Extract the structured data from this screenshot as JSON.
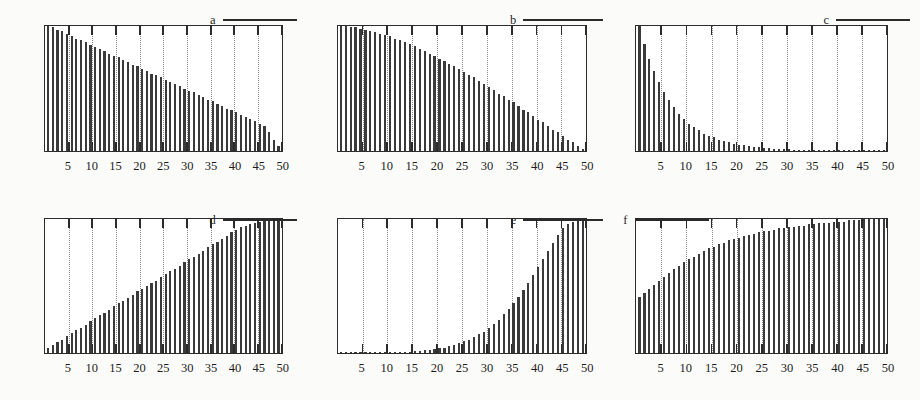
{
  "figure": {
    "title": "",
    "panel_count": 6,
    "layout": "2 rows x 3 columns",
    "ink_color": "#3a3a3a",
    "frame_color": "#2c2c2c",
    "gridline_color": "#8a8a8a",
    "background_color": "#fbfbfa"
  },
  "axis": {
    "tick_labels": [
      "5",
      "10",
      "15",
      "20",
      "25",
      "30",
      "35",
      "40",
      "45",
      "50"
    ],
    "tick_values": [
      5,
      10,
      15,
      20,
      25,
      30,
      35,
      40,
      45,
      50
    ],
    "xmin": 0,
    "xmax": 50,
    "xlabel": "",
    "ylabel": ""
  },
  "chart_data": [
    {
      "type": "bar",
      "panel": "a",
      "title": "a",
      "legend": "a",
      "legend_position": "top-right",
      "xlabel": "",
      "ylabel": "",
      "xlim": [
        0,
        50
      ],
      "ylim": [
        0,
        100
      ],
      "grid": true,
      "categories": [
        1,
        2,
        3,
        4,
        5,
        6,
        7,
        8,
        9,
        10,
        11,
        12,
        13,
        14,
        15,
        16,
        17,
        18,
        19,
        20,
        21,
        22,
        23,
        24,
        25,
        26,
        27,
        28,
        29,
        30,
        31,
        32,
        33,
        34,
        35,
        36,
        37,
        38,
        39,
        40,
        41,
        42,
        43,
        44,
        45,
        46,
        47,
        48,
        49,
        50
      ],
      "values": [
        100,
        99,
        97,
        96,
        94,
        92,
        90,
        89,
        87,
        85,
        83,
        82,
        80,
        78,
        76,
        75,
        73,
        71,
        69,
        68,
        66,
        64,
        62,
        61,
        59,
        57,
        55,
        54,
        52,
        50,
        48,
        47,
        45,
        43,
        41,
        40,
        38,
        36,
        34,
        33,
        31,
        29,
        27,
        26,
        24,
        22,
        20,
        15,
        9,
        4
      ]
    },
    {
      "type": "bar",
      "panel": "b",
      "title": "b",
      "legend": "b",
      "legend_position": "top-right",
      "xlabel": "",
      "ylabel": "",
      "xlim": [
        0,
        50
      ],
      "ylim": [
        0,
        100
      ],
      "grid": true,
      "categories": [
        1,
        2,
        3,
        4,
        5,
        6,
        7,
        8,
        9,
        10,
        11,
        12,
        13,
        14,
        15,
        16,
        17,
        18,
        19,
        20,
        21,
        22,
        23,
        24,
        25,
        26,
        27,
        28,
        29,
        30,
        31,
        32,
        33,
        34,
        35,
        36,
        37,
        38,
        39,
        40,
        41,
        42,
        43,
        44,
        45,
        46,
        47,
        48,
        49,
        50
      ],
      "values": [
        100,
        100,
        99,
        99,
        98,
        97,
        96,
        95,
        94,
        93,
        92,
        90,
        89,
        87,
        86,
        84,
        82,
        80,
        78,
        76,
        74,
        72,
        70,
        68,
        66,
        63,
        61,
        59,
        56,
        54,
        51,
        49,
        46,
        44,
        41,
        39,
        36,
        33,
        31,
        28,
        25,
        23,
        20,
        17,
        15,
        12,
        9,
        7,
        4,
        2
      ]
    },
    {
      "type": "bar",
      "panel": "c",
      "title": "c",
      "legend": "c",
      "legend_position": "top-right",
      "xlabel": "",
      "ylabel": "",
      "xlim": [
        0,
        50
      ],
      "ylim": [
        0,
        100
      ],
      "grid": true,
      "categories": [
        1,
        2,
        3,
        4,
        5,
        6,
        7,
        8,
        9,
        10,
        11,
        12,
        13,
        14,
        15,
        16,
        17,
        18,
        19,
        20,
        21,
        22,
        23,
        24,
        25,
        26,
        27,
        28,
        29,
        30,
        31,
        32,
        33,
        34,
        35,
        36,
        37,
        38,
        39,
        40,
        41,
        42,
        43,
        44,
        45,
        46,
        47,
        48,
        49,
        50
      ],
      "values": [
        100,
        86,
        74,
        64,
        55,
        47,
        41,
        35,
        30,
        26,
        22,
        19,
        17,
        14,
        12,
        11,
        9,
        8,
        7,
        6,
        5,
        4.5,
        4,
        3.5,
        3,
        2.6,
        2.2,
        2,
        1.7,
        1.5,
        1.3,
        1.1,
        1,
        0.9,
        0.8,
        0.7,
        0.6,
        0.5,
        0.45,
        0.4,
        0.35,
        0.3,
        0.3,
        0.25,
        0.2,
        0.2,
        0.15,
        0.15,
        0.1,
        0.1
      ]
    },
    {
      "type": "bar",
      "panel": "d",
      "title": "d",
      "legend": "d",
      "legend_position": "top-right",
      "xlabel": "",
      "ylabel": "",
      "xlim": [
        0,
        50
      ],
      "ylim": [
        0,
        100
      ],
      "grid": true,
      "categories": [
        1,
        2,
        3,
        4,
        5,
        6,
        7,
        8,
        9,
        10,
        11,
        12,
        13,
        14,
        15,
        16,
        17,
        18,
        19,
        20,
        21,
        22,
        23,
        24,
        25,
        26,
        27,
        28,
        29,
        30,
        31,
        32,
        33,
        34,
        35,
        36,
        37,
        38,
        39,
        40,
        41,
        42,
        43,
        44,
        45,
        46,
        47,
        48,
        49,
        50
      ],
      "values": [
        4,
        6,
        8,
        10,
        13,
        15,
        17,
        19,
        21,
        24,
        26,
        28,
        30,
        32,
        35,
        37,
        39,
        41,
        43,
        46,
        48,
        50,
        52,
        54,
        57,
        59,
        61,
        63,
        65,
        68,
        70,
        72,
        74,
        76,
        79,
        81,
        83,
        85,
        87,
        90,
        92,
        94,
        95,
        96,
        97,
        98,
        99,
        99,
        100,
        100
      ]
    },
    {
      "type": "bar",
      "panel": "e",
      "title": "e",
      "legend": "e",
      "legend_position": "top-right",
      "xlabel": "",
      "ylabel": "",
      "xlim": [
        0,
        50
      ],
      "ylim": [
        0,
        100
      ],
      "grid": true,
      "categories": [
        1,
        2,
        3,
        4,
        5,
        6,
        7,
        8,
        9,
        10,
        11,
        12,
        13,
        14,
        15,
        16,
        17,
        18,
        19,
        20,
        21,
        22,
        23,
        24,
        25,
        26,
        27,
        28,
        29,
        30,
        31,
        32,
        33,
        34,
        35,
        36,
        37,
        38,
        39,
        40,
        41,
        42,
        43,
        44,
        45,
        46,
        47,
        48,
        49,
        50
      ],
      "values": [
        0.5,
        0.4,
        0.35,
        0.3,
        0.3,
        0.25,
        0.25,
        0.2,
        0.2,
        0.2,
        0.3,
        0.4,
        0.5,
        0.7,
        0.9,
        1.2,
        1.5,
        1.9,
        2.3,
        2.8,
        3.4,
        4.1,
        5,
        6,
        7.2,
        8.6,
        10,
        12,
        14,
        16,
        19,
        22,
        25,
        29,
        33,
        37,
        42,
        47,
        52,
        58,
        64,
        70,
        76,
        82,
        88,
        93,
        96,
        98,
        99,
        100
      ]
    },
    {
      "type": "bar",
      "panel": "f",
      "title": "f",
      "legend": "f",
      "legend_position": "top-left",
      "xlabel": "",
      "ylabel": "",
      "xlim": [
        0,
        50
      ],
      "ylim": [
        0,
        100
      ],
      "grid": true,
      "categories": [
        1,
        2,
        3,
        4,
        5,
        6,
        7,
        8,
        9,
        10,
        11,
        12,
        13,
        14,
        15,
        16,
        17,
        18,
        19,
        20,
        21,
        22,
        23,
        24,
        25,
        26,
        27,
        28,
        29,
        30,
        31,
        32,
        33,
        34,
        35,
        36,
        37,
        38,
        39,
        40,
        41,
        42,
        43,
        44,
        45,
        46,
        47,
        48,
        49,
        50
      ],
      "values": [
        42,
        45,
        48,
        51,
        54,
        57,
        60,
        63,
        65,
        68,
        70,
        72,
        74,
        76,
        78,
        79,
        81,
        82,
        84,
        85,
        86,
        87,
        88,
        89,
        90,
        91,
        91,
        92,
        93,
        93,
        94,
        94,
        95,
        95,
        96,
        96,
        97,
        97,
        97,
        98,
        98,
        98,
        99,
        99,
        99,
        100,
        100,
        100,
        100,
        100
      ]
    }
  ]
}
